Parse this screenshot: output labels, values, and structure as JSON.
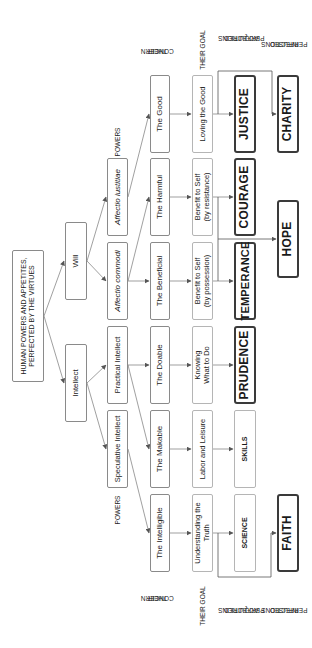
{
  "root": {
    "line1": "HUMAN POWERS AND APPETITES,",
    "line2": "PERFECTED BY THE VIRTUES"
  },
  "faculties": {
    "will": "Will",
    "intellect": "Intellect"
  },
  "powers": {
    "affectio_iustitiae": "Affectio iustitiae",
    "affectio_commodi": "Affectio commodi",
    "practical_intellect": "Practical Intellect",
    "speculative_intellect": "Speculative Intellect"
  },
  "concerns": {
    "good": "The Good",
    "harmful": "The Harmful",
    "beneficial": "The Beneficial",
    "doable": "The Doable",
    "makable": "The Makable",
    "intelligible": "The Intelligible"
  },
  "goals": {
    "loving_good": "Loving the Good",
    "resistance": {
      "line1": "Benefit to Self",
      "line2": "(by resistance)"
    },
    "possession": {
      "line1": "Benefit to Self",
      "line2": "(by possession)"
    },
    "knowing": {
      "line1": "Knowing",
      "line2": "What to Do"
    },
    "labor": "Labor and Leisure",
    "truth": {
      "line1": "Understanding the",
      "line2": "Truth"
    }
  },
  "acquired": {
    "justice": "JUSTICE",
    "courage": "COURAGE",
    "temperance": "TEMPERANCE",
    "prudence": "PRUDENCE",
    "skills": "SKILLS",
    "science": "SCIENCE"
  },
  "infused": {
    "charity": "CHARITY",
    "hope": "HOPE",
    "faith": "FAITH"
  },
  "labels": {
    "powers": "POWERS",
    "their_concern": {
      "line1": "THEIR",
      "line2": "CONCERN"
    },
    "their_goal": "THEIR GOAL",
    "acquired": {
      "line1": "ACQUIRED",
      "line2": "PERFECTIONS"
    },
    "infused": {
      "line1": "INFUSED",
      "line2": "PERFECTIONS"
    }
  }
}
